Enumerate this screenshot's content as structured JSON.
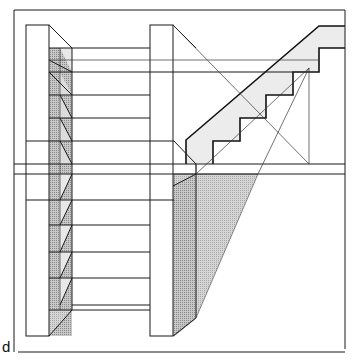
{
  "figure": {
    "label": "d",
    "colors": {
      "line": "#1a1a1a",
      "shade_light": "#e6e6e6",
      "shade_mid": "#bdbdbd",
      "shade_dark": "#9a9a9a",
      "background": "#ffffff"
    }
  }
}
